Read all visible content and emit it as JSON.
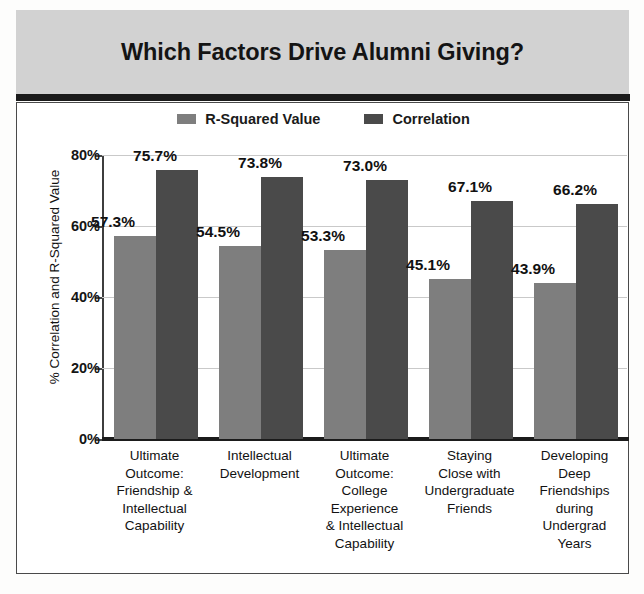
{
  "header": {
    "title": "Which Factors Drive Alumni Giving?"
  },
  "colors": {
    "title_band": "#d2d2d2",
    "rule": "#1b1b1b",
    "r_squared_bar": "#7e7e7e",
    "correlation_bar": "#4a4a4a",
    "gridline": "#c9c9c9",
    "text": "#111111"
  },
  "chart_data": {
    "type": "bar",
    "title": "Which Factors Drive Alumni Giving?",
    "xlabel": "",
    "ylabel": "% Correlation and R-Squared Value",
    "ylim": [
      0,
      80
    ],
    "yticks": [
      0,
      20,
      40,
      60,
      80
    ],
    "ytick_labels": [
      "0%",
      "20%",
      "40%",
      "60%",
      "80%"
    ],
    "grid": true,
    "legend_position": "top-center",
    "categories": [
      "Ultimate Outcome: Friendship & Intellectual Capability",
      "Intellectual Development",
      "Ultimate Outcome: College Experience & Intellectual Capability",
      "Staying Close with Undergraduate Friends",
      "Developing Deep Friendships during Undergrad Years"
    ],
    "category_lines": [
      [
        "Ultimate",
        "Outcome:",
        "Friendship &",
        "Intellectual",
        "Capability"
      ],
      [
        "Intellectual",
        "Development"
      ],
      [
        "Ultimate",
        "Outcome:",
        "College",
        "Experience",
        "& Intellectual",
        "Capability"
      ],
      [
        "Staying",
        "Close with",
        "Undergraduate",
        "Friends"
      ],
      [
        "Developing",
        "Deep",
        "Friendships",
        "during",
        "Undergrad",
        "Years"
      ]
    ],
    "series": [
      {
        "name": "R-Squared Value",
        "color": "#7e7e7e",
        "values": [
          57.3,
          54.5,
          53.3,
          45.1,
          43.9
        ],
        "value_labels": [
          "57.3%",
          "54.5%",
          "53.3%",
          "45.1%",
          "43.9%"
        ]
      },
      {
        "name": "Correlation",
        "color": "#4a4a4a",
        "values": [
          75.7,
          73.8,
          73.0,
          67.1,
          66.2
        ],
        "value_labels": [
          "75.7%",
          "73.8%",
          "73.0%",
          "67.1%",
          "66.2%"
        ]
      }
    ]
  },
  "legend": {
    "items": [
      {
        "label": "R-Squared Value",
        "color": "#7e7e7e"
      },
      {
        "label": "Correlation",
        "color": "#4a4a4a"
      }
    ]
  }
}
